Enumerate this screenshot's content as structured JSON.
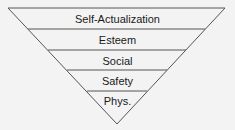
{
  "diagram": {
    "type": "inverted-pyramid",
    "levels": [
      {
        "label": "Self-Actualization"
      },
      {
        "label": "Esteem"
      },
      {
        "label": "Social"
      },
      {
        "label": "Safety"
      },
      {
        "label": "Phys."
      }
    ],
    "colors": {
      "line": "#555555",
      "background": "#f3f3f3",
      "text": "#1a1a1a"
    }
  }
}
